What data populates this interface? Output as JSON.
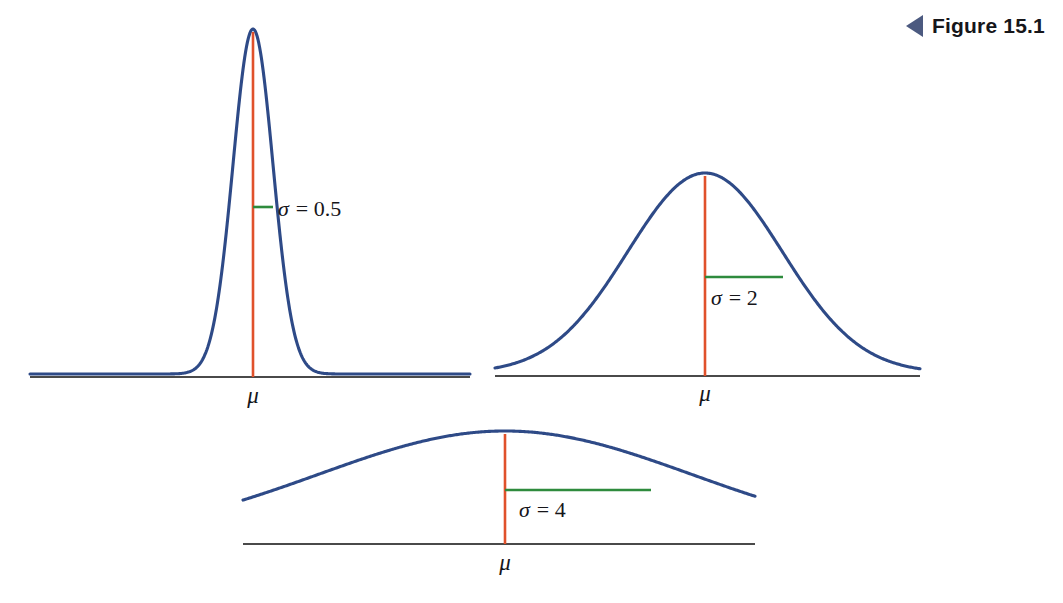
{
  "figure": {
    "caption": "Figure 15.1",
    "marker_icon": "left-triangle-icon"
  },
  "colors": {
    "curve": "#2e4a87",
    "mean_line": "#e0512b",
    "sigma_line": "#2e8b3d",
    "axis": "#4a4a4a",
    "caption_marker": "#4c5a80",
    "text": "#16161a",
    "background": "#ffffff"
  },
  "chart_data": {
    "type": "line",
    "title": "Figure 15.1",
    "xlabel": "",
    "ylabel": "",
    "grid": false,
    "legend": "none",
    "panels": [
      {
        "id": "panel-sigma-0-5",
        "sigma": 0.5,
        "sigma_label": "= 0.5",
        "sigma_symbol": "σ",
        "mean_label": "μ",
        "peak_height_px": 345,
        "half_width_ratio": 0.0455,
        "axis_span_px": 440,
        "sigma_marker_y_fraction": 0.607
      },
      {
        "id": "panel-sigma-2",
        "sigma": 2,
        "sigma_label": "= 2",
        "sigma_symbol": "σ",
        "mean_label": "μ",
        "peak_height_px": 200,
        "half_width_ratio": 0.182,
        "axis_span_px": 425,
        "sigma_marker_y_fraction": 0.607
      },
      {
        "id": "panel-sigma-4",
        "sigma": 4,
        "sigma_label": "= 4",
        "sigma_symbol": "σ",
        "mean_label": "μ",
        "peak_height_px": 110,
        "half_width_ratio": 0.364,
        "axis_span_px": 512,
        "sigma_marker_y_fraction": 0.607
      }
    ],
    "x": [
      -5,
      -4.5,
      -4,
      -3.5,
      -3,
      -2.5,
      -2,
      -1.5,
      -1,
      -0.5,
      0,
      0.5,
      1,
      1.5,
      2,
      2.5,
      3,
      3.5,
      4,
      4.5,
      5
    ],
    "series": [
      {
        "name": "σ = 0.5",
        "values": [
          0,
          0,
          0,
          0,
          0,
          0,
          0.0001,
          0.0089,
          0.1353,
          0.6065,
          1,
          0.6065,
          0.1353,
          0.0089,
          0.0001,
          0,
          0,
          0,
          0,
          0,
          0
        ]
      },
      {
        "name": "σ = 2",
        "values": [
          0.0439,
          0.0796,
          0.1353,
          0.2163,
          0.3247,
          0.4578,
          0.6065,
          0.7548,
          0.8825,
          0.9692,
          1,
          0.9692,
          0.8825,
          0.7548,
          0.6065,
          0.4578,
          0.3247,
          0.2163,
          0.1353,
          0.0796,
          0.0439
        ]
      },
      {
        "name": "σ = 4",
        "values": [
          0.4578,
          0.5311,
          0.6065,
          0.6807,
          0.7548,
          0.8226,
          0.8825,
          0.9321,
          0.9692,
          0.9922,
          1,
          0.9922,
          0.9692,
          0.9321,
          0.8825,
          0.8226,
          0.7548,
          0.6807,
          0.6065,
          0.5311,
          0.4578
        ]
      }
    ]
  }
}
